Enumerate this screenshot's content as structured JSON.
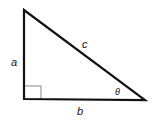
{
  "diagram": {
    "labels": {
      "vertical_leg": "a",
      "horizontal_leg": "b",
      "hypotenuse": "c",
      "angle": "θ"
    },
    "colors": {
      "stroke": "#111111",
      "right_angle_marker": "#999999",
      "background": "#ffffff"
    }
  }
}
